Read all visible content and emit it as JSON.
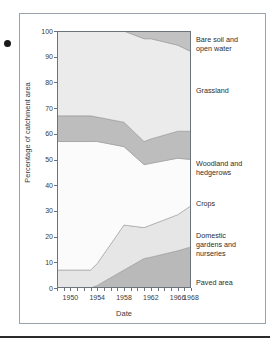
{
  "figure": {
    "bullet_marker": "figure-bullet"
  },
  "axes": {
    "y_title": "Percentage of catchment area",
    "x_title": "Date",
    "y_ticks": [
      "0",
      "10",
      "20",
      "30",
      "40",
      "50",
      "60",
      "70",
      "80",
      "90",
      "100"
    ],
    "x_ticks": [
      "1950",
      "1954",
      "1958",
      "1962",
      "1966",
      "1968"
    ]
  },
  "legend": {
    "entries": [
      "Bare soil and\nopen water",
      "Grassland",
      "Woodland and\nhedgerows",
      "Crops",
      "Domestic\ngardens and\nnurseries",
      "Paved area"
    ]
  },
  "colors": {
    "paved_area": "#b9b9b9",
    "domestic_gardens": "#e6e6e6",
    "crops": "#fbfbfb",
    "woodland_hedgerows": "#bdbdbd",
    "grassland": "#ebebeb",
    "bare_soil_open_water": "#c2c2c2",
    "axis": "#6d737a",
    "text": "#3a3a3a",
    "frame": "#9aa3ab",
    "rule": "#2b2b2b"
  },
  "chart_data": {
    "type": "area",
    "stacked": true,
    "title": "",
    "xlabel": "Date",
    "ylabel": "Percentage of catchment area",
    "xlim": [
      1948,
      1968
    ],
    "ylim": [
      0,
      100
    ],
    "grid": false,
    "legend_position": "right-outside",
    "x": [
      1948,
      1953,
      1954,
      1958,
      1961,
      1962,
      1966,
      1968
    ],
    "series": [
      {
        "name": "Paved area",
        "values": [
          0,
          0,
          1,
          7,
          11.5,
          12,
          14.5,
          16
        ]
      },
      {
        "name": "Domestic gardens and nurseries",
        "values": [
          7,
          7,
          8.5,
          17.5,
          12,
          12.5,
          14,
          16
        ]
      },
      {
        "name": "Crops",
        "values": [
          50,
          50,
          47.5,
          30.5,
          24.5,
          24,
          22,
          18
        ]
      },
      {
        "name": "Woodland and hedgerows",
        "values": [
          10,
          10,
          9.5,
          9.5,
          9,
          9.5,
          10.5,
          11
        ]
      },
      {
        "name": "Grassland",
        "values": [
          33,
          33,
          33.5,
          35.5,
          40,
          39,
          35.5,
          31
        ]
      },
      {
        "name": "Bare soil and open water",
        "values": [
          0,
          0,
          0,
          0,
          3,
          3,
          5.5,
          8
        ]
      }
    ],
    "cumulative_tops": {
      "paved_area": [
        0,
        0,
        1,
        7,
        11.5,
        12,
        14.5,
        16
      ],
      "domestic_gardens": [
        7,
        7,
        9.5,
        24.5,
        23.5,
        24.5,
        28.5,
        32
      ],
      "crops": [
        57,
        57,
        57,
        55,
        48,
        48.5,
        50.5,
        50
      ],
      "woodland_hedgerows": [
        67,
        67,
        66.5,
        64.5,
        57,
        58,
        61,
        61
      ],
      "grassland": [
        100,
        100,
        100,
        100,
        97,
        97,
        94.5,
        92
      ],
      "bare_soil_open_water": [
        100,
        100,
        100,
        100,
        100,
        100,
        100,
        100
      ]
    }
  }
}
